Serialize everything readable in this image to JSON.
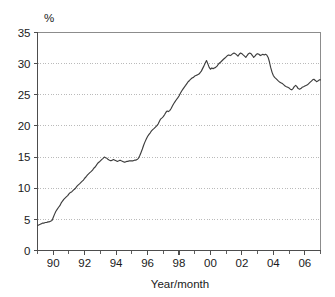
{
  "chart_data": {
    "type": "line",
    "title": "",
    "subtitle": "",
    "xlabel": "Year/month",
    "ylabel": "%",
    "unit_label": "%",
    "xlim": [
      1989.0,
      2007.0
    ],
    "ylim": [
      0,
      35
    ],
    "grid": true,
    "grid_axis": "y",
    "legend": false,
    "legend_position": "none",
    "y_ticks": [
      0,
      5,
      10,
      15,
      20,
      25,
      30,
      35
    ],
    "y_tick_labels": [
      "0",
      "5",
      "10",
      "15",
      "20",
      "25",
      "30",
      "35"
    ],
    "x_ticks": [
      1990,
      1992,
      1994,
      1996,
      1998,
      2000,
      2002,
      2004,
      2006
    ],
    "x_tick_labels": [
      "90",
      "92",
      "94",
      "96",
      "98",
      "00",
      "02",
      "04",
      "06"
    ],
    "x_minor_ticks": [
      1989,
      1990,
      1991,
      1992,
      1993,
      1994,
      1995,
      1996,
      1997,
      1998,
      1999,
      2000,
      2001,
      2002,
      2003,
      2004,
      2005,
      2006,
      2007
    ],
    "series": [
      {
        "name": "share",
        "color": "#3d3d3d",
        "x": [
          1989.0,
          1989.08,
          1989.17,
          1989.25,
          1989.33,
          1989.42,
          1989.5,
          1989.58,
          1989.67,
          1989.75,
          1989.83,
          1989.92,
          1990.0,
          1990.08,
          1990.17,
          1990.25,
          1990.33,
          1990.42,
          1990.5,
          1990.58,
          1990.67,
          1990.75,
          1990.83,
          1990.92,
          1991.0,
          1991.08,
          1991.17,
          1991.25,
          1991.33,
          1991.42,
          1991.5,
          1991.58,
          1991.67,
          1991.75,
          1991.83,
          1991.92,
          1992.0,
          1992.08,
          1992.17,
          1992.25,
          1992.33,
          1992.42,
          1992.5,
          1992.58,
          1992.67,
          1992.75,
          1992.83,
          1992.92,
          1993.0,
          1993.08,
          1993.17,
          1993.25,
          1993.33,
          1993.42,
          1993.5,
          1993.58,
          1993.67,
          1993.75,
          1993.83,
          1993.92,
          1994.0,
          1994.08,
          1994.17,
          1994.25,
          1994.33,
          1994.42,
          1994.5,
          1994.58,
          1994.67,
          1994.75,
          1994.83,
          1994.92,
          1995.0,
          1995.08,
          1995.17,
          1995.25,
          1995.33,
          1995.42,
          1995.5,
          1995.58,
          1995.67,
          1995.75,
          1995.83,
          1995.92,
          1996.0,
          1996.08,
          1996.17,
          1996.25,
          1996.33,
          1996.42,
          1996.5,
          1996.58,
          1996.67,
          1996.75,
          1996.83,
          1996.92,
          1997.0,
          1997.08,
          1997.17,
          1997.25,
          1997.33,
          1997.42,
          1997.5,
          1997.58,
          1997.67,
          1997.75,
          1997.83,
          1997.92,
          1998.0,
          1998.08,
          1998.17,
          1998.25,
          1998.33,
          1998.42,
          1998.5,
          1998.58,
          1998.67,
          1998.75,
          1998.83,
          1998.92,
          1999.0,
          1999.08,
          1999.17,
          1999.25,
          1999.33,
          1999.42,
          1999.5,
          1999.58,
          1999.67,
          1999.75,
          1999.83,
          1999.92,
          2000.0,
          2000.08,
          2000.17,
          2000.25,
          2000.33,
          2000.42,
          2000.5,
          2000.58,
          2000.67,
          2000.75,
          2000.83,
          2000.92,
          2001.0,
          2001.08,
          2001.17,
          2001.25,
          2001.33,
          2001.42,
          2001.5,
          2001.58,
          2001.67,
          2001.75,
          2001.83,
          2001.92,
          2002.0,
          2002.08,
          2002.17,
          2002.25,
          2002.33,
          2002.42,
          2002.5,
          2002.58,
          2002.67,
          2002.75,
          2002.83,
          2002.92,
          2003.0,
          2003.08,
          2003.17,
          2003.25,
          2003.33,
          2003.42,
          2003.5,
          2003.58,
          2003.67,
          2003.75,
          2003.83,
          2003.92,
          2004.0,
          2004.08,
          2004.17,
          2004.25,
          2004.33,
          2004.42,
          2004.5,
          2004.58,
          2004.67,
          2004.75,
          2004.83,
          2004.92,
          2005.0,
          2005.08,
          2005.17,
          2005.25,
          2005.33,
          2005.42,
          2005.5,
          2005.58,
          2005.67,
          2005.75,
          2005.83,
          2005.92,
          2006.0,
          2006.08,
          2006.17,
          2006.25,
          2006.33,
          2006.42,
          2006.5,
          2006.58,
          2006.67,
          2006.75,
          2006.83,
          2006.92,
          2007.0
        ],
        "y": [
          4.0,
          4.1,
          4.2,
          4.3,
          4.4,
          4.4,
          4.5,
          4.5,
          4.6,
          4.6,
          4.7,
          4.8,
          5.3,
          5.8,
          6.3,
          6.6,
          6.9,
          7.2,
          7.6,
          7.9,
          8.2,
          8.4,
          8.6,
          8.8,
          9.1,
          9.3,
          9.4,
          9.6,
          9.8,
          10.0,
          10.3,
          10.5,
          10.7,
          10.9,
          11.1,
          11.3,
          11.6,
          11.8,
          12.1,
          12.3,
          12.5,
          12.7,
          12.9,
          13.2,
          13.4,
          13.7,
          14.0,
          14.2,
          14.4,
          14.6,
          14.8,
          15.0,
          14.9,
          14.8,
          14.6,
          14.5,
          14.4,
          14.5,
          14.6,
          14.5,
          14.4,
          14.3,
          14.4,
          14.5,
          14.4,
          14.3,
          14.2,
          14.2,
          14.3,
          14.3,
          14.4,
          14.4,
          14.4,
          14.4,
          14.5,
          14.5,
          14.6,
          14.8,
          15.2,
          15.7,
          16.3,
          16.9,
          17.4,
          17.9,
          18.3,
          18.6,
          18.9,
          19.2,
          19.4,
          19.6,
          19.8,
          20.0,
          20.3,
          20.7,
          21.1,
          21.3,
          21.5,
          21.8,
          22.2,
          22.4,
          22.3,
          22.5,
          22.8,
          23.2,
          23.6,
          23.9,
          24.2,
          24.5,
          24.8,
          25.2,
          25.6,
          25.9,
          26.2,
          26.5,
          26.8,
          27.1,
          27.3,
          27.5,
          27.7,
          27.8,
          28.0,
          28.1,
          28.2,
          28.3,
          28.5,
          28.8,
          29.2,
          29.6,
          30.1,
          30.5,
          30.0,
          29.4,
          29.1,
          29.3,
          29.2,
          29.3,
          29.4,
          29.6,
          29.9,
          30.1,
          30.3,
          30.5,
          30.7,
          30.9,
          31.1,
          31.3,
          31.4,
          31.3,
          31.4,
          31.6,
          31.7,
          31.6,
          31.4,
          31.2,
          31.5,
          31.7,
          31.6,
          31.4,
          31.2,
          31.0,
          31.3,
          31.6,
          31.7,
          31.6,
          31.3,
          31.0,
          31.2,
          31.5,
          31.6,
          31.5,
          31.3,
          31.4,
          31.5,
          31.4,
          31.5,
          31.4,
          31.0,
          30.3,
          29.4,
          28.6,
          28.1,
          27.8,
          27.6,
          27.4,
          27.2,
          27.0,
          26.9,
          26.8,
          26.6,
          26.4,
          26.3,
          26.2,
          26.1,
          25.9,
          25.8,
          26.0,
          26.3,
          26.5,
          26.3,
          26.0,
          25.9,
          26.0,
          26.2,
          26.3,
          26.4,
          26.5,
          26.6,
          26.8,
          27.0,
          27.2,
          27.4,
          27.5,
          27.3,
          27.1,
          27.2,
          27.4,
          27.4
        ]
      }
    ]
  },
  "axes": {
    "unit_label": "%",
    "x_title": "Year/month"
  }
}
